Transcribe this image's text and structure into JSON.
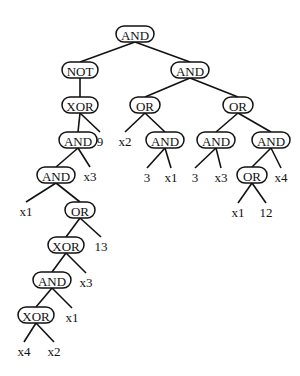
{
  "diagram": {
    "type": "expression-tree",
    "nodes": [
      {
        "id": "n0",
        "label": "AND",
        "kind": "op",
        "x": 135,
        "y": 34,
        "w": 38
      },
      {
        "id": "n1",
        "label": "NOT",
        "kind": "op",
        "x": 80,
        "y": 70,
        "w": 36
      },
      {
        "id": "n2",
        "label": "AND",
        "kind": "op",
        "x": 190,
        "y": 70,
        "w": 38
      },
      {
        "id": "n3",
        "label": "XOR",
        "kind": "op",
        "x": 80,
        "y": 105,
        "w": 36
      },
      {
        "id": "n4",
        "label": "OR",
        "kind": "op",
        "x": 145,
        "y": 105,
        "w": 30
      },
      {
        "id": "n5",
        "label": "OR",
        "kind": "op",
        "x": 238,
        "y": 105,
        "w": 30
      },
      {
        "id": "n6",
        "label": "AND",
        "kind": "op",
        "x": 78,
        "y": 140,
        "w": 38
      },
      {
        "id": "n7",
        "label": "9",
        "kind": "leaf",
        "x": 100,
        "y": 140
      },
      {
        "id": "n8",
        "label": "x2",
        "kind": "leaf",
        "x": 125,
        "y": 140
      },
      {
        "id": "n9",
        "label": "AND",
        "kind": "op",
        "x": 165,
        "y": 140,
        "w": 38
      },
      {
        "id": "n10",
        "label": "AND",
        "kind": "op",
        "x": 216,
        "y": 140,
        "w": 38
      },
      {
        "id": "n11",
        "label": "AND",
        "kind": "op",
        "x": 271,
        "y": 140,
        "w": 38
      },
      {
        "id": "n12",
        "label": "AND",
        "kind": "op",
        "x": 56,
        "y": 175,
        "w": 38
      },
      {
        "id": "n13",
        "label": "x3",
        "kind": "leaf",
        "x": 90,
        "y": 175
      },
      {
        "id": "n14",
        "label": "3",
        "kind": "leaf",
        "x": 147,
        "y": 176
      },
      {
        "id": "n15",
        "label": "x1",
        "kind": "leaf",
        "x": 171,
        "y": 176
      },
      {
        "id": "n16",
        "label": "3",
        "kind": "leaf",
        "x": 195,
        "y": 176
      },
      {
        "id": "n17",
        "label": "x3",
        "kind": "leaf",
        "x": 221,
        "y": 176
      },
      {
        "id": "n18",
        "label": "OR",
        "kind": "op",
        "x": 252,
        "y": 175,
        "w": 30
      },
      {
        "id": "n19",
        "label": "x4",
        "kind": "leaf",
        "x": 281,
        "y": 176
      },
      {
        "id": "n20",
        "label": "x1",
        "kind": "leaf",
        "x": 26,
        "y": 210
      },
      {
        "id": "n21",
        "label": "OR",
        "kind": "op",
        "x": 80,
        "y": 210,
        "w": 30
      },
      {
        "id": "n22",
        "label": "x1",
        "kind": "leaf",
        "x": 238,
        "y": 211
      },
      {
        "id": "n23",
        "label": "12",
        "kind": "leaf",
        "x": 266,
        "y": 211
      },
      {
        "id": "n24",
        "label": "XOR",
        "kind": "op",
        "x": 66,
        "y": 245,
        "w": 36
      },
      {
        "id": "n25",
        "label": "13",
        "kind": "leaf",
        "x": 101,
        "y": 245
      },
      {
        "id": "n26",
        "label": "AND",
        "kind": "op",
        "x": 52,
        "y": 280,
        "w": 38
      },
      {
        "id": "n27",
        "label": "x3",
        "kind": "leaf",
        "x": 86,
        "y": 281
      },
      {
        "id": "n28",
        "label": "XOR",
        "kind": "op",
        "x": 36,
        "y": 315,
        "w": 36
      },
      {
        "id": "n29",
        "label": "x1",
        "kind": "leaf",
        "x": 72,
        "y": 316
      },
      {
        "id": "n30",
        "label": "x4",
        "kind": "leaf",
        "x": 24,
        "y": 350
      },
      {
        "id": "n31",
        "label": "x2",
        "kind": "leaf",
        "x": 54,
        "y": 350
      }
    ],
    "edges": [
      [
        "n0",
        "n1"
      ],
      [
        "n0",
        "n2"
      ],
      [
        "n1",
        "n3"
      ],
      [
        "n2",
        "n4"
      ],
      [
        "n2",
        "n5"
      ],
      [
        "n3",
        "n6"
      ],
      [
        "n3",
        "n7"
      ],
      [
        "n4",
        "n8"
      ],
      [
        "n4",
        "n9"
      ],
      [
        "n5",
        "n10"
      ],
      [
        "n5",
        "n11"
      ],
      [
        "n6",
        "n12"
      ],
      [
        "n6",
        "n13"
      ],
      [
        "n9",
        "n14"
      ],
      [
        "n9",
        "n15"
      ],
      [
        "n10",
        "n16"
      ],
      [
        "n10",
        "n17"
      ],
      [
        "n11",
        "n18"
      ],
      [
        "n11",
        "n19"
      ],
      [
        "n12",
        "n20"
      ],
      [
        "n12",
        "n21"
      ],
      [
        "n18",
        "n22"
      ],
      [
        "n18",
        "n23"
      ],
      [
        "n21",
        "n24"
      ],
      [
        "n21",
        "n25"
      ],
      [
        "n24",
        "n26"
      ],
      [
        "n24",
        "n27"
      ],
      [
        "n26",
        "n28"
      ],
      [
        "n26",
        "n29"
      ],
      [
        "n28",
        "n30"
      ],
      [
        "n28",
        "n31"
      ]
    ]
  }
}
